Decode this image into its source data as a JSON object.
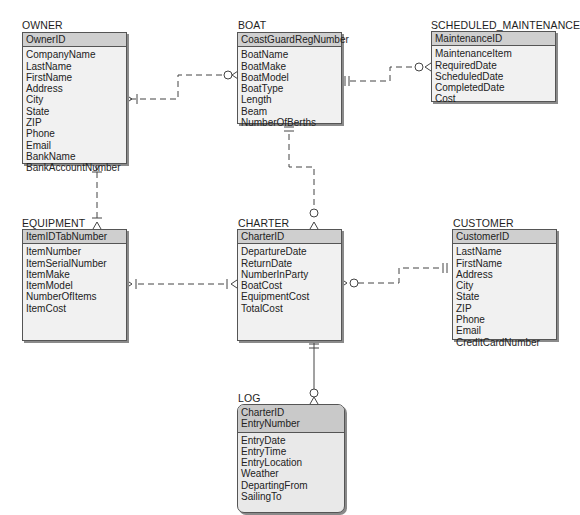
{
  "diagram": {
    "type": "entity-relationship",
    "notation": "crows-foot"
  },
  "entities": {
    "owner": {
      "name": "OWNER",
      "primary_key": [
        "OwnerID"
      ],
      "attributes": [
        "CompanyName",
        "LastName",
        "FirstName",
        "Address",
        "City",
        "State",
        "ZIP",
        "Phone",
        "Email",
        "BankName",
        "BankAccountNumber"
      ]
    },
    "boat": {
      "name": "BOAT",
      "primary_key": [
        "CoastGuardRegNumber"
      ],
      "attributes": [
        "BoatName",
        "BoatMake",
        "BoatModel",
        "BoatType",
        "Length",
        "Beam",
        "NumberOfBerths"
      ]
    },
    "scheduled_maintenance": {
      "name": "SCHEDULED_MAINTENANCE",
      "primary_key": [
        "MaintenanceID"
      ],
      "attributes": [
        "MaintenanceItem",
        "RequiredDate",
        "ScheduledDate",
        "CompletedDate",
        "Cost"
      ]
    },
    "equipment": {
      "name": "EQUIPMENT",
      "primary_key": [
        "ItemIDTabNumber"
      ],
      "attributes": [
        "ItemNumber",
        "ItemSerialNumber",
        "ItemMake",
        "ItemModel",
        "NumberOfItems",
        "ItemCost"
      ]
    },
    "charter": {
      "name": "CHARTER",
      "primary_key": [
        "CharterID"
      ],
      "attributes": [
        "DepartureDate",
        "ReturnDate",
        "NumberInParty",
        "BoatCost",
        "EquipmentCost",
        "TotalCost"
      ]
    },
    "customer": {
      "name": "CUSTOMER",
      "primary_key": [
        "CustomerID"
      ],
      "attributes": [
        "LastName",
        "FirstName",
        "Address",
        "City",
        "State",
        "ZIP",
        "Phone",
        "Email",
        "CreditCardNumber"
      ]
    },
    "log": {
      "name": "LOG",
      "primary_key": [
        "CharterID",
        "EntryNumber"
      ],
      "attributes": [
        "EntryDate",
        "EntryTime",
        "EntryLocation",
        "Weather",
        "DepartingFrom",
        "SailingTo"
      ],
      "weak_entity": true
    }
  },
  "relationships": [
    {
      "from": "OWNER",
      "to": "BOAT",
      "from_end": "one-and-only-one (|) with crow's foot mark",
      "to_end": "zero-or-many",
      "line": "dashed"
    },
    {
      "from": "BOAT",
      "to": "SCHEDULED_MAINTENANCE",
      "from_end": "one-and-only-one",
      "to_end": "zero-or-many",
      "line": "dashed"
    },
    {
      "from": "OWNER",
      "to": "EQUIPMENT",
      "from_end": "one-and-only-one",
      "to_end": "one-or-many",
      "line": "dashed"
    },
    {
      "from": "BOAT",
      "to": "CHARTER",
      "from_end": "one-and-only-one",
      "to_end": "zero-or-many",
      "line": "dashed"
    },
    {
      "from": "EQUIPMENT",
      "to": "CHARTER",
      "from_end": "one-or-many",
      "to_end": "one-or-many",
      "line": "dashed"
    },
    {
      "from": "CUSTOMER",
      "to": "CHARTER",
      "from_end": "one-and-only-one",
      "to_end": "zero-or-many",
      "line": "dashed"
    },
    {
      "from": "CHARTER",
      "to": "LOG",
      "from_end": "one-and-only-one",
      "to_end": "zero-or-many",
      "line": "solid"
    }
  ]
}
